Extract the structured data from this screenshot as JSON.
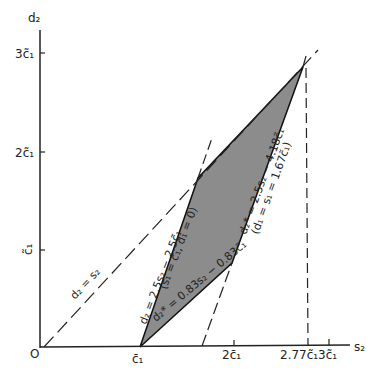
{
  "axes": {
    "x_label": "s₂",
    "y_label": "d₂",
    "origin_label": "O",
    "x_ticks": [
      {
        "label": "c̄₁",
        "x": 140
      },
      {
        "label": "2c̄₁",
        "x": 234
      },
      {
        "label": "2.77c̃₁",
        "x": 307
      },
      {
        "label": "3c̃₁",
        "x": 329
      }
    ],
    "y_ticks": [
      {
        "label": "c̃₁",
        "y": 250
      },
      {
        "label": "2c̃₁",
        "y": 152
      },
      {
        "label": "3c̃₁",
        "y": 53
      }
    ]
  },
  "lines": {
    "diag": "d₂ = s₂",
    "steep": "d₂ = 2.5s₂ − 2.5c̃₁",
    "mid": "(s₁ = c̃₁, d₁ = 0)",
    "lower": "d₂* = 0.83s₂ − 0.83c̃₁",
    "right": "d₂* = 2.5s₂ − 4.18c̃₁",
    "right_cond": "(d₁ = s₁ = 1.67c̃₁)"
  },
  "region": {
    "fill": "#8c8c8c",
    "vertices": [
      [
        140,
        347
      ],
      [
        232,
        263
      ],
      [
        303,
        67
      ],
      [
        198,
        178
      ]
    ]
  }
}
